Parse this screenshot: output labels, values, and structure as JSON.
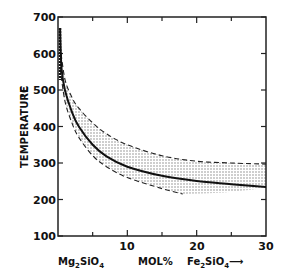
{
  "chart_data": {
    "type": "line",
    "title": "",
    "xlabel": "MOL %",
    "ylabel": "TEMPERATURE °C",
    "x_left_label": "Mg2SiO4",
    "x_right_label": "Fe2SiO4 →",
    "xlim": [
      0,
      30
    ],
    "ylim": [
      100,
      700
    ],
    "x_ticks": [
      10,
      20,
      30
    ],
    "y_ticks": [
      100,
      200,
      300,
      400,
      500,
      600,
      700
    ],
    "grid": false,
    "series": [
      {
        "name": "solvus (solid)",
        "style": "solid",
        "x": [
          0.3,
          0.5,
          1,
          2,
          3,
          5,
          7,
          10,
          15,
          20,
          25,
          30
        ],
        "y": [
          670,
          560,
          500,
          440,
          400,
          350,
          318,
          290,
          265,
          251,
          242,
          234
        ]
      },
      {
        "name": "upper bound (dashed)",
        "style": "dashed",
        "x": [
          0.3,
          1,
          2,
          3,
          5,
          7,
          10,
          15,
          20,
          25,
          30
        ],
        "y": [
          620,
          530,
          480,
          450,
          410,
          380,
          350,
          320,
          305,
          300,
          297
        ]
      },
      {
        "name": "lower bound (dashed)",
        "style": "dashed",
        "x": [
          0.3,
          1,
          2,
          3,
          5,
          7,
          10,
          15,
          18
        ],
        "y": [
          560,
          470,
          410,
          370,
          320,
          290,
          260,
          230,
          215
        ]
      }
    ],
    "annotations": [
      "stippled band between dashed bounds"
    ]
  },
  "labels": {
    "y_title": "TEMPERATURE",
    "y_unit": "°C",
    "y_ticks": [
      "700",
      "600",
      "500",
      "400",
      "300",
      "200",
      "100"
    ],
    "x_ticks": [
      "10",
      "20",
      "30"
    ],
    "x_left": "Mg",
    "x_left_sub1": "2",
    "x_left_mid": "SiO",
    "x_left_sub2": "4",
    "x_mid": "MOL",
    "x_mid_pct": "%",
    "x_right": "Fe",
    "x_right_sub1": "2",
    "x_right_mid": "SiO",
    "x_right_sub2": "4",
    "x_right_arrow": "⟶"
  }
}
